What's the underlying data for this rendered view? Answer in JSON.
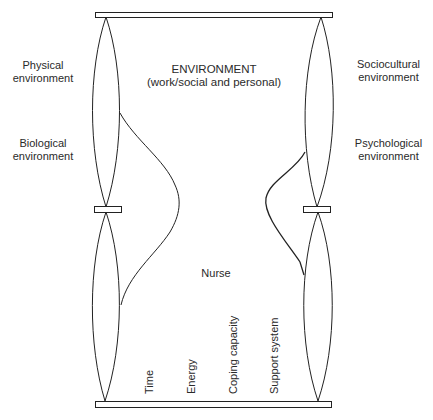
{
  "diagram": {
    "center": {
      "title": "ENVIRONMENT",
      "subtitle": "(work/social and personal)"
    },
    "left_labels": [
      {
        "line1": "Physical",
        "line2": "environment"
      },
      {
        "line1": "Biological",
        "line2": "environment"
      }
    ],
    "right_labels": [
      {
        "line1": "Sociocultural",
        "line2": "environment"
      },
      {
        "line1": "Psychological",
        "line2": "environment"
      }
    ],
    "nurse_label": "Nurse",
    "resources": [
      "Time",
      "Energy",
      "Coping capacity",
      "Support system"
    ],
    "colors": {
      "stroke": "#222222",
      "text": "#2a2a2a",
      "background": "#ffffff"
    }
  }
}
